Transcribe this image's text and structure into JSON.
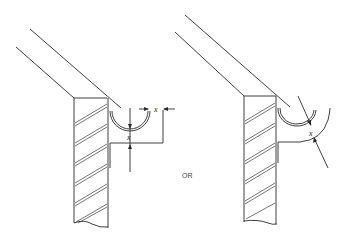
{
  "diagram": {
    "left_figure": {
      "name": "box-fascia-gutter",
      "dimension_labels": [
        "x",
        "x"
      ]
    },
    "right_figure": {
      "name": "curved-bracket-gutter",
      "dimension_labels": [
        "x"
      ]
    },
    "separator_label": "OR",
    "colors": {
      "line": "#2a2a2a",
      "background": "#ffffff"
    }
  }
}
